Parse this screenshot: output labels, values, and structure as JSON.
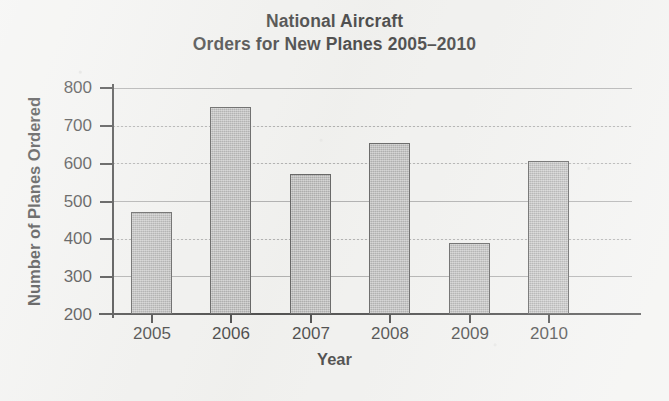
{
  "chart_data": {
    "type": "bar",
    "title_lines": [
      "National Aircraft",
      "Orders for New Planes 2005–2010"
    ],
    "xlabel": "Year",
    "ylabel": "Number of Planes Ordered",
    "categories": [
      "2005",
      "2006",
      "2007",
      "2008",
      "2009",
      "2010"
    ],
    "values": [
      470,
      750,
      573,
      655,
      388,
      607
    ],
    "ylim": [
      200,
      800
    ],
    "ytick_step": 100,
    "yticks": [
      800,
      700,
      600,
      500,
      400,
      300,
      200
    ],
    "grid": true,
    "legend": "none",
    "bar_color": "#a6a6a6",
    "bar_edge_color": "#3a3a3a",
    "grid_color": "#8d8d8d",
    "axis_color": "#1d1d1d",
    "background_color": "#f1f1ef"
  },
  "axes": {
    "y_title": "Number of Planes Ordered",
    "x_title": "Year"
  }
}
